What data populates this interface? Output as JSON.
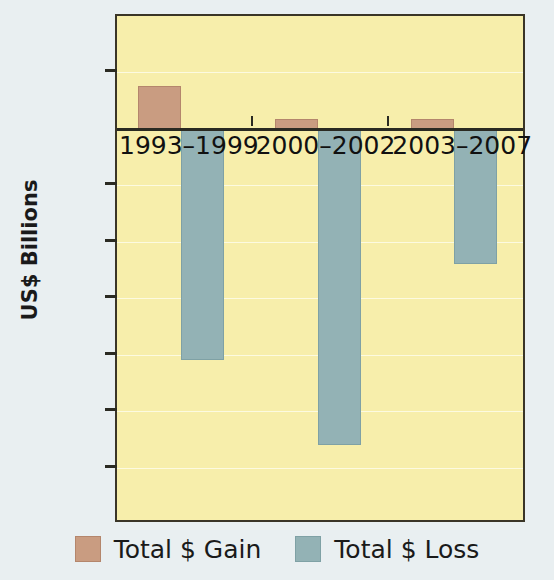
{
  "chart_data": {
    "type": "bar",
    "title": "",
    "subtitle": "",
    "xlabel": "",
    "ylabel": "US$ Billions",
    "categories": [
      "1993–1999",
      "2000–2002",
      "2003–2007"
    ],
    "series": [
      {
        "name": "Total $ Gain",
        "color": "#c99c81",
        "values": [
          38,
          9,
          9
        ]
      },
      {
        "name": "Total $ Loss",
        "color": "#93b2b5",
        "values": [
          -205,
          -280,
          -120
        ]
      }
    ],
    "ylim": [
      -350,
      100
    ],
    "yticks": [
      100,
      50,
      0,
      -50,
      -100,
      -150,
      -200,
      -250,
      -300,
      -350
    ],
    "ytick_labels": [
      "100",
      "50",
      "0",
      "−50",
      "−100",
      "−150",
      "−200",
      "−250",
      "−300",
      "−350"
    ],
    "grid": true,
    "grid_axis": "y",
    "legend_position": "bottom",
    "plot_background": "#f7eeab",
    "figure_background": "#e9eff1",
    "zero_line": 0
  },
  "legend": {
    "items": [
      {
        "label": "Total $ Gain",
        "swatch": "gain"
      },
      {
        "label": "Total $ Loss",
        "swatch": "loss"
      }
    ]
  }
}
